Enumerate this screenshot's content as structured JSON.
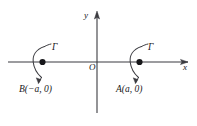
{
  "figure": {
    "type": "coordinate-diagram",
    "axes": {
      "x_label": "x",
      "y_label": "y",
      "origin_label": "O"
    },
    "points": [
      {
        "id": "B",
        "label": "B(−a, 0)",
        "contour_label": "Γ"
      },
      {
        "id": "A",
        "label": "A(a, 0)",
        "contour_label": "Γ"
      }
    ],
    "colors": {
      "line": "#3b3b40",
      "text": "#17171a",
      "background": "#ffffff"
    }
  }
}
